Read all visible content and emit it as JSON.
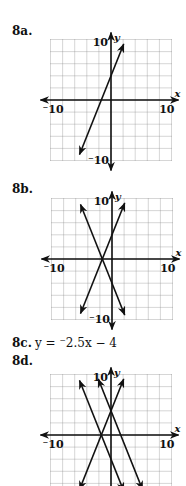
{
  "problems": [
    {
      "id": "8a",
      "label": "8a.",
      "top": 24,
      "graph": {
        "x0": 50,
        "y0": 40,
        "x_axis_y": 100,
        "y_axis_x": 111,
        "lines": [
          {
            "m": 2.5,
            "b": 4,
            "x1": -5.2,
            "x2": 2.1
          }
        ]
      }
    },
    {
      "id": "8b",
      "label": "8b.",
      "top": 182,
      "graph": {
        "x0": 51,
        "y0": 198,
        "x_axis_y": 259,
        "y_axis_x": 112,
        "lines": [
          {
            "m": 2.5,
            "b": 4,
            "x1": -5.2,
            "x2": 2.1
          },
          {
            "m": -2.5,
            "b": -4,
            "x1": -5.2,
            "x2": 2.1
          }
        ]
      }
    },
    {
      "id": "8c",
      "label": "8c.",
      "top": 336,
      "equation": {
        "lhs": "y",
        "rhs": "= ⁻2.5x − 4"
      }
    },
    {
      "id": "8d",
      "label": "8d.",
      "top": 354,
      "graph": {
        "x0": 50,
        "y0": 373,
        "x_axis_y": 435,
        "y_axis_x": 111,
        "lines": [
          {
            "m": 2.5,
            "b": 4,
            "x1": -5.2,
            "x2": 2.1
          },
          {
            "m": -2.5,
            "b": -4,
            "x1": -5.2,
            "x2": 2.1
          },
          {
            "m": -2.5,
            "b": 4,
            "x1": -2.1,
            "x2": 5.2
          }
        ]
      }
    }
  ],
  "axes": {
    "x_label": "x",
    "y_label": "y",
    "x_min_label": "⁻10",
    "x_max_label": "10",
    "y_max_label": "10",
    "y_min_label": "⁻10",
    "range": [
      -10,
      10
    ],
    "grid_step": 2
  },
  "equation_8c": "y = ⁻2.5x − 4",
  "colors": {
    "grid": "#8a8a8a",
    "axis": "#111111",
    "line": "#111111",
    "background": "#ffffff"
  },
  "chart_data": [
    {
      "type": "line",
      "title": "8a",
      "x_range": [
        -10,
        10
      ],
      "y_range": [
        -10,
        10
      ],
      "grid": true,
      "xlabel": "x",
      "ylabel": "y",
      "series": [
        {
          "name": "y = 2.5x + 4",
          "slope": 2.5,
          "intercept": 4
        }
      ]
    },
    {
      "type": "line",
      "title": "8b",
      "x_range": [
        -10,
        10
      ],
      "y_range": [
        -10,
        10
      ],
      "grid": true,
      "xlabel": "x",
      "ylabel": "y",
      "series": [
        {
          "name": "y = 2.5x + 4",
          "slope": 2.5,
          "intercept": 4
        },
        {
          "name": "y = -2.5x - 4",
          "slope": -2.5,
          "intercept": -4
        }
      ]
    },
    {
      "type": "line",
      "title": "8d",
      "x_range": [
        -10,
        10
      ],
      "y_range": [
        -10,
        10
      ],
      "grid": true,
      "xlabel": "x",
      "ylabel": "y",
      "series": [
        {
          "name": "y = 2.5x + 4",
          "slope": 2.5,
          "intercept": 4
        },
        {
          "name": "y = -2.5x - 4",
          "slope": -2.5,
          "intercept": -4
        },
        {
          "name": "y = -2.5x + 4",
          "slope": -2.5,
          "intercept": 4
        }
      ]
    }
  ]
}
